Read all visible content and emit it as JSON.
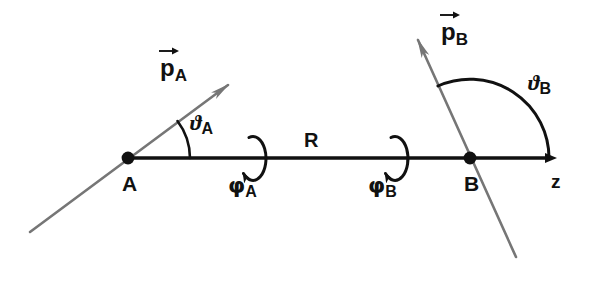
{
  "figure": {
    "background_color": "#ffffff",
    "axis_color": "#111111",
    "vector_color": "#767676",
    "width": 598,
    "height": 282
  },
  "axis": {
    "name": "z-axis",
    "label": "z",
    "label_x": 551,
    "label_y": 172,
    "y": 158,
    "x_start": 128,
    "x_end": 558
  },
  "points": [
    {
      "id": "A",
      "label": "A",
      "x": 128,
      "y": 158,
      "label_x": 122,
      "label_y": 173
    },
    {
      "id": "B",
      "label": "B",
      "x": 470,
      "y": 158,
      "label_x": 464,
      "label_y": 173
    }
  ],
  "vectors": [
    {
      "id": "pA",
      "symbol": "p",
      "subscript": "A",
      "accent": "right-arrow-overline",
      "label_x": 160,
      "label_y": 56,
      "tail_x": 30,
      "tail_y": 232,
      "tip_x": 228,
      "tip_y": 85,
      "color": "#767676"
    },
    {
      "id": "pB",
      "symbol": "p",
      "subscript": "B",
      "accent": "right-arrow-overline",
      "label_x": 441,
      "label_y": 20,
      "tail_x": 516,
      "tail_y": 257,
      "tip_x": 418,
      "tip_y": 40,
      "color": "#767676"
    }
  ],
  "angles": [
    {
      "id": "thetaA",
      "symbol": "ϑ",
      "subscript": "A",
      "label_x": 190,
      "label_y": 112,
      "center_x": 128,
      "center_y": 158,
      "radius": 62,
      "arc_from_deg": 0,
      "arc_to_deg": 37
    },
    {
      "id": "thetaB",
      "symbol": "ϑ",
      "subscript": "B",
      "label_x": 528,
      "label_y": 72,
      "center_x": 470,
      "center_y": 158,
      "radius": 79,
      "arc_from_deg": 0,
      "arc_to_deg": 114
    },
    {
      "id": "phiA",
      "symbol": "φ",
      "subscript": "A",
      "label_x": 228,
      "label_y": 175,
      "loop_center_x": 256,
      "loop_center_y": 158,
      "loop_rx": 13,
      "loop_ry": 22
    },
    {
      "id": "phiB",
      "symbol": "φ",
      "subscript": "B",
      "label_x": 368,
      "label_y": 175,
      "loop_center_x": 398,
      "loop_center_y": 158,
      "loop_rx": 13,
      "loop_ry": 22
    }
  ],
  "distance": {
    "id": "R",
    "label": "R",
    "label_x": 304,
    "label_y": 130,
    "from_point": "A",
    "to_point": "B"
  }
}
